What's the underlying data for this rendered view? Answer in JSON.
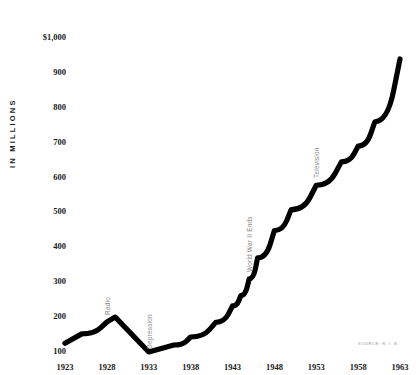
{
  "chart_data": {
    "type": "line",
    "title": "",
    "xlabel": "",
    "ylabel": "IN MILLIONS",
    "xlim": [
      1923,
      1963
    ],
    "ylim": [
      100,
      1000
    ],
    "grid": false,
    "legend": null,
    "line_color": "#000000",
    "x": [
      1923,
      1925,
      1928,
      1929,
      1933,
      1936,
      1938,
      1941,
      1943,
      1944,
      1945,
      1946,
      1948,
      1950,
      1953,
      1956,
      1958,
      1960,
      1963
    ],
    "values": [
      125,
      152,
      186,
      200,
      100,
      120,
      143,
      185,
      232,
      262,
      310,
      370,
      448,
      508,
      578,
      645,
      690,
      760,
      940
    ],
    "y_ticks": [
      100,
      200,
      300,
      400,
      500,
      600,
      700,
      800,
      900,
      1000
    ],
    "y_tick_labels": [
      "100",
      "200",
      "300",
      "400",
      "500",
      "600",
      "700",
      "800",
      "900",
      "$1,000"
    ],
    "x_ticks": [
      1923,
      1928,
      1933,
      1938,
      1943,
      1948,
      1953,
      1958,
      1963
    ],
    "x_tick_labels": [
      "1923",
      "1928",
      "1933",
      "1938",
      "1943",
      "1948",
      "1953",
      "1958",
      "1963"
    ],
    "annotations": [
      {
        "label": "Radio",
        "x": 1928,
        "y": 205
      },
      {
        "label": "Depression",
        "x": 1933,
        "y": 108
      },
      {
        "label": "World War II Ends",
        "x": 1945,
        "y": 330
      },
      {
        "label": "Television",
        "x": 1953,
        "y": 600
      }
    ],
    "source": "SOURCE: R. I. B."
  }
}
